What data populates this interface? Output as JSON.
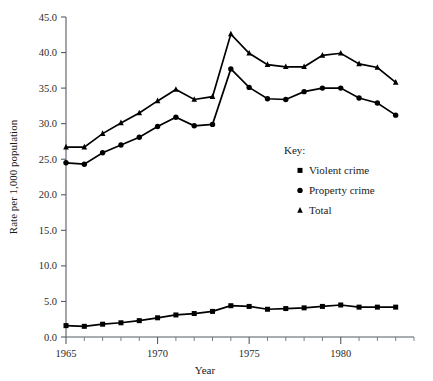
{
  "chart_data": {
    "type": "line",
    "title": "",
    "xlabel": "Year",
    "ylabel": "Rate per 1,000 population",
    "xlim": [
      1965,
      1984
    ],
    "ylim": [
      0.0,
      45.0
    ],
    "grid": false,
    "legend_position": "inside-right",
    "legend_title": "Key:",
    "x": [
      1965,
      1966,
      1967,
      1968,
      1969,
      1970,
      1971,
      1972,
      1973,
      1974,
      1975,
      1976,
      1977,
      1978,
      1979,
      1980,
      1981,
      1982,
      1983
    ],
    "series": [
      {
        "name": "Violent crime",
        "marker": "square",
        "values": [
          1.6,
          1.5,
          1.8,
          2.0,
          2.3,
          2.7,
          3.1,
          3.3,
          3.6,
          4.4,
          4.3,
          3.9,
          4.0,
          4.1,
          4.3,
          4.5,
          4.2,
          4.2,
          4.2
        ]
      },
      {
        "name": "Property crime",
        "marker": "circle",
        "values": [
          24.5,
          24.3,
          25.9,
          27.0,
          28.1,
          29.6,
          30.9,
          29.7,
          29.9,
          37.7,
          35.1,
          33.5,
          33.4,
          34.5,
          35.0,
          35.0,
          33.6,
          32.9,
          31.2
        ]
      },
      {
        "name": "Total",
        "marker": "triangle",
        "values": [
          26.7,
          26.7,
          28.6,
          30.1,
          31.5,
          33.2,
          34.8,
          33.4,
          33.8,
          42.6,
          39.9,
          38.3,
          38.0,
          38.0,
          39.6,
          39.9,
          38.4,
          37.9,
          35.8
        ]
      }
    ],
    "x_major_ticks": [
      1965,
      1970,
      1975,
      1980
    ],
    "x_major_tick_labels": [
      "1965",
      "1970",
      "1975",
      "1980"
    ],
    "y_major_ticks": [
      0.0,
      5.0,
      10.0,
      15.0,
      20.0,
      25.0,
      30.0,
      35.0,
      40.0,
      45.0
    ],
    "y_major_tick_labels": [
      "0.0",
      "5.0",
      "10.0",
      "15.0",
      "20.0",
      "25.0",
      "30.0",
      "35.0",
      "40.0",
      "45.0"
    ],
    "colors": {
      "line": "#000000",
      "marker": "#000000",
      "axis": "#555c63",
      "text": "#1a1a1a",
      "background": "#ffffff"
    }
  }
}
